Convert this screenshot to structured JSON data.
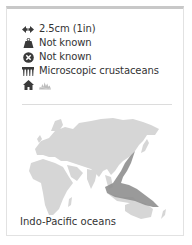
{
  "facts": {
    "size": {
      "icon": "width-arrows-icon",
      "value": "2.5cm (1in)"
    },
    "weight": {
      "icon": "weight-icon",
      "value": "Not known"
    },
    "status": {
      "icon": "no-status-icon",
      "value": "Not known"
    },
    "diet": {
      "icon": "diet-comb-icon",
      "value": "Microscopic crustaceans"
    },
    "habitat": {
      "icons": [
        "home-icon",
        "reef-habitat-icon"
      ]
    }
  },
  "map": {
    "caption": "Indo-Pacific oceans",
    "land_color": "#d6d6d6",
    "range_color": "#8f8f8f"
  },
  "colors": {
    "text": "#333333",
    "icon": "#3a3a3a",
    "card_top_border": "#c8c8c8",
    "card_border": "#e2e2e2",
    "divider": "#dcdcdc"
  }
}
